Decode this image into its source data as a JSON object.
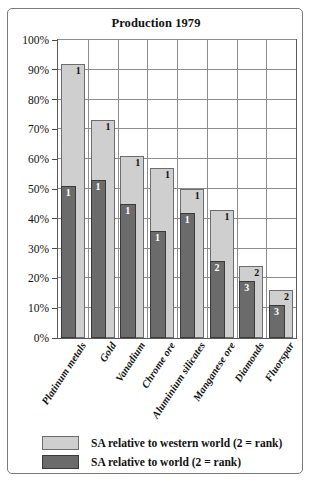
{
  "chart_data": {
    "type": "bar",
    "title": "Production 1979",
    "xlabel": "",
    "ylabel": "",
    "ylim": [
      0,
      100
    ],
    "ytick_labels": [
      "0%",
      "10%",
      "20%",
      "30%",
      "40%",
      "50%",
      "60%",
      "70%",
      "80%",
      "90%",
      "100%"
    ],
    "ytick_values": [
      0,
      10,
      20,
      30,
      40,
      50,
      60,
      70,
      80,
      90,
      100
    ],
    "grid": true,
    "legend_position": "bottom",
    "categories": [
      "Platinum metals",
      "Gold",
      "Vanadium",
      "Chrome ore",
      "Aluminium silicates",
      "Manganese ore",
      "Diamonds",
      "Fluorspar"
    ],
    "series": [
      {
        "name": "SA relative to western world (2 = rank)",
        "color": "#cfcfcf",
        "values": [
          92,
          73,
          61,
          57,
          50,
          43,
          24,
          16
        ],
        "ranks": [
          "1",
          "1",
          "1",
          "1",
          "1",
          "1",
          "2",
          "2"
        ]
      },
      {
        "name": "SA relative to world (2 = rank)",
        "color": "#6b6b6b",
        "values": [
          51,
          53,
          45,
          36,
          42,
          26,
          19,
          11
        ],
        "ranks": [
          "1",
          "1",
          "1",
          "1",
          "1",
          "2",
          "3",
          "3"
        ]
      }
    ]
  },
  "legend": {
    "items": [
      {
        "label": "SA relative to western world (2 = rank)",
        "swatch": "light"
      },
      {
        "label": "SA relative to world (2 = rank)",
        "swatch": "dark"
      }
    ]
  }
}
